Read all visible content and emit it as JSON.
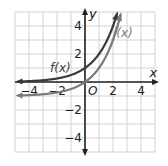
{
  "chart_data": {
    "type": "line",
    "title": "",
    "xlabel": "x",
    "ylabel": "y",
    "origin_label": "O",
    "xlim": [
      -5,
      5
    ],
    "ylim": [
      -5,
      5
    ],
    "grid": true,
    "x_ticks": [
      {
        "value": -4,
        "label": "−4"
      },
      {
        "value": -2,
        "label": "−2"
      },
      {
        "value": 2,
        "label": "2"
      },
      {
        "value": 4,
        "label": "4"
      }
    ],
    "y_ticks": [
      {
        "value": 4,
        "label": "4"
      },
      {
        "value": 2,
        "label": "2"
      },
      {
        "value": -2,
        "label": "−2"
      },
      {
        "value": -4,
        "label": "−4"
      }
    ],
    "series": [
      {
        "name": "f(x)",
        "color": "#3a3a3a",
        "x": [
          -5,
          -4,
          -3,
          -2,
          -1,
          0,
          1,
          2,
          2.32
        ],
        "values": [
          0.03,
          0.06,
          0.13,
          0.25,
          0.5,
          1,
          2,
          4,
          5
        ]
      },
      {
        "name": "j(x)",
        "color": "#7a7a7a",
        "x": [
          -5,
          -4,
          -3,
          -2,
          -1,
          0,
          1,
          2,
          2.58
        ],
        "values": [
          -0.97,
          -0.94,
          -0.88,
          -0.75,
          -0.5,
          0,
          1,
          3,
          5
        ]
      }
    ],
    "legend": "inline labels near curves"
  },
  "labels": {
    "f": "f(x)",
    "j": "j(x)",
    "x_axis": "x",
    "y_axis": "y",
    "origin": "O"
  }
}
